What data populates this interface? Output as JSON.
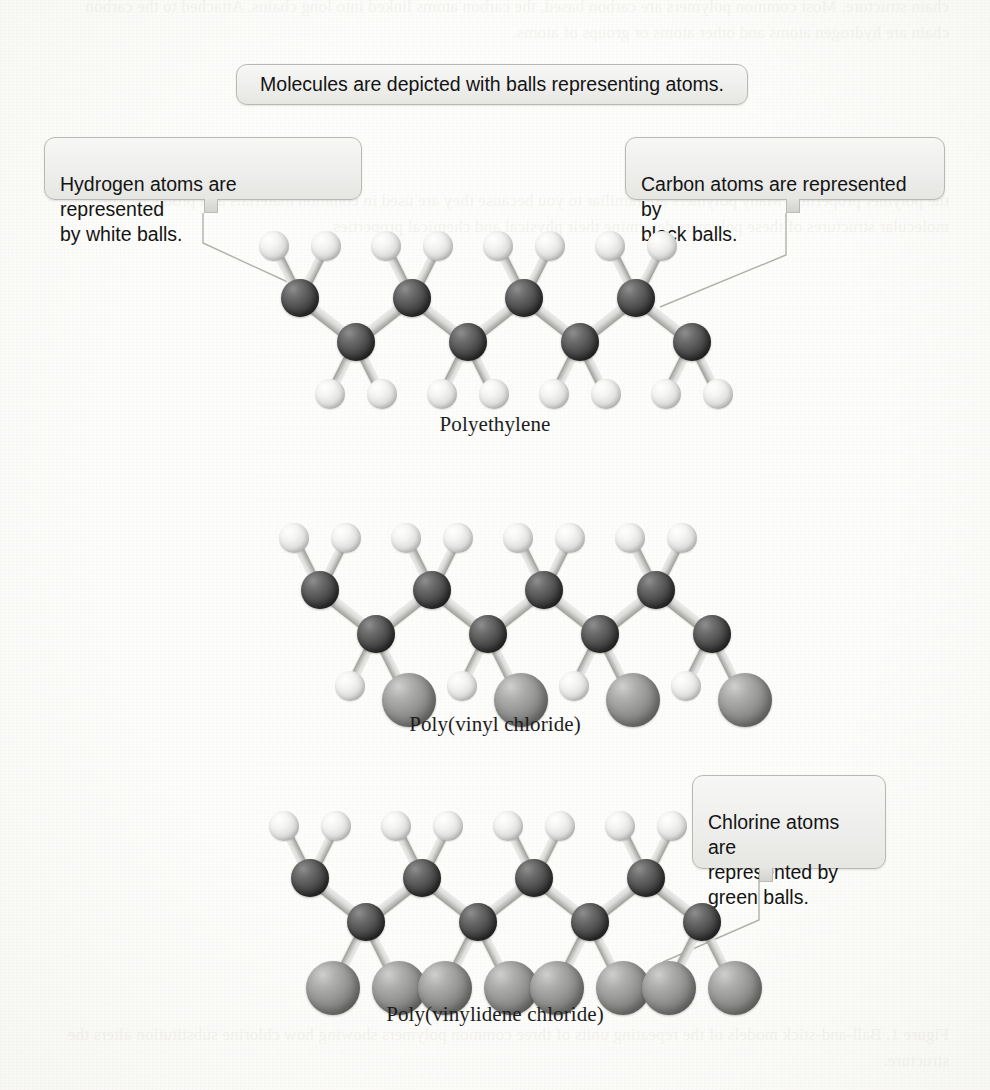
{
  "figure": {
    "type": "ball-and-stick polymer structure diagram",
    "background_note": "scanned textbook page with faint reverse-side bleed-through text"
  },
  "callouts": [
    {
      "id": "molecules",
      "text": "Molecules are depicted with balls representing atoms.",
      "position": "top-center"
    },
    {
      "id": "hydrogen",
      "text": "Hydrogen atoms are represented\nby white balls.",
      "position": "upper-left",
      "points_to": "white hydrogen ball on polyethylene chain"
    },
    {
      "id": "carbon",
      "text": "Carbon atoms are represented by\nblack balls.",
      "position": "upper-right",
      "points_to": "black carbon ball on polyethylene chain"
    },
    {
      "id": "chlorine",
      "text": "Chlorine atoms are\nrepresented by\ngreen balls.",
      "position": "lower-right",
      "points_to": "green chlorine ball on poly(vinylidene chloride) chain"
    }
  ],
  "molecules": [
    {
      "id": "polyethylene",
      "caption": "Polyethylene",
      "repeat_unit": "CH2-CH2",
      "backbone_carbons": 8,
      "substituents": {
        "upper_carbons": [
          "hydrogen",
          "hydrogen"
        ],
        "lower_carbons": [
          "hydrogen",
          "hydrogen"
        ]
      }
    },
    {
      "id": "poly-vinyl-chloride",
      "caption": "Poly(vinyl chloride)",
      "repeat_unit": "CH2-CHCl",
      "backbone_carbons": 8,
      "substituents": {
        "upper_carbons": [
          "hydrogen",
          "hydrogen"
        ],
        "lower_carbons": [
          "hydrogen",
          "chlorine"
        ]
      }
    },
    {
      "id": "poly-vinylidene-chloride",
      "caption": "Poly(vinylidene chloride)",
      "repeat_unit": "CH2-CCl2",
      "backbone_carbons": 8,
      "substituents": {
        "upper_carbons": [
          "hydrogen",
          "hydrogen"
        ],
        "lower_carbons": [
          "chlorine",
          "chlorine"
        ]
      }
    }
  ],
  "atom_legend": [
    {
      "element": "Hydrogen",
      "symbol": "H",
      "ball_color_name": "white",
      "hex": "#efefed",
      "radius_px": 15
    },
    {
      "element": "Carbon",
      "symbol": "C",
      "ball_color_name": "black",
      "hex": "#3a3a3a",
      "radius_px": 19
    },
    {
      "element": "Chlorine",
      "symbol": "Cl",
      "ball_color_name": "green",
      "hex": "#8e8e8c",
      "radius_px": 27
    }
  ],
  "ghost_text": {
    "top": "chain structure. Most common polymers are carbon based, the carbon atoms linked into long chains. Attached to the carbon chain are hydrogen atoms and other atoms or groups of atoms.",
    "middle": "the polymer properties. Many polymers are familiar to you because they are used in common materials and products. The molecular structures of these polymers determine their physical and chemical properties.",
    "bottom": "Figure 1. Ball-and-stick models of the repeating units of three common polymers showing how chlorine substitution alters the structure."
  }
}
